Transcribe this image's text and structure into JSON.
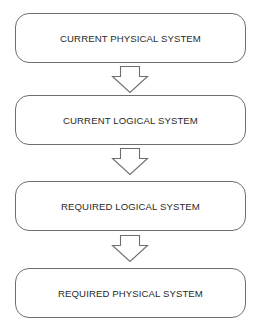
{
  "diagram": {
    "type": "vertical-flow",
    "stages": [
      {
        "label": "CURRENT PHYSICAL SYSTEM"
      },
      {
        "label": "CURRENT LOGICAL SYSTEM"
      },
      {
        "label": "REQUIRED LOGICAL SYSTEM"
      },
      {
        "label": "REQUIRED PHYSICAL SYSTEM"
      }
    ],
    "connectors": [
      {
        "from": 0,
        "to": 1,
        "icon": "down-arrow-icon"
      },
      {
        "from": 1,
        "to": 2,
        "icon": "down-arrow-icon"
      },
      {
        "from": 2,
        "to": 3,
        "icon": "down-arrow-icon"
      }
    ],
    "colors": {
      "stroke": "#6e6e6e",
      "text": "#2a2a2a",
      "background": "#ffffff"
    }
  }
}
